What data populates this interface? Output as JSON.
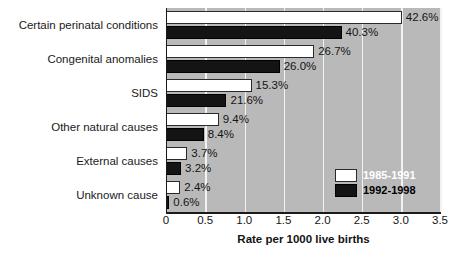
{
  "chart_data": {
    "type": "bar",
    "orientation": "horizontal",
    "title": "",
    "xlabel": "Rate per 1000 live births",
    "ylabel": "",
    "xlim": [
      0,
      3.5
    ],
    "xticks": [
      "0",
      "0.5",
      "1.0",
      "1.5",
      "2.0",
      "2.5",
      "3.0",
      "3.5"
    ],
    "xtick_values": [
      0,
      0.5,
      1.0,
      1.5,
      2.0,
      2.5,
      3.0,
      3.5
    ],
    "grid": true,
    "grid_axis": "x",
    "legend_position": "bottom-right",
    "categories": [
      "Certain perinatal conditions",
      "Congenital anomalies",
      "SIDS",
      "Other natural causes",
      "External causes",
      "Unknown cause"
    ],
    "series": [
      {
        "name": "1985-1991",
        "color": "#ffffff",
        "values": [
          3.0,
          1.88,
          1.08,
          0.66,
          0.26,
          0.17
        ],
        "labels": [
          "42.6%",
          "26.7%",
          "15.3%",
          "9.4%",
          "3.7%",
          "2.4%"
        ]
      },
      {
        "name": "1992-1998",
        "color": "#141414",
        "values": [
          2.23,
          1.44,
          0.76,
          0.47,
          0.18,
          0.03
        ],
        "labels": [
          "40.3%",
          "26.0%",
          "21.6%",
          "8.4%",
          "3.2%",
          "0.6%"
        ]
      }
    ],
    "plot_background": "#b9b9b9",
    "gridline_color": "#f2f2f2"
  },
  "legend": {
    "items": [
      {
        "label": "1985-1991",
        "swatch": "white"
      },
      {
        "label": "1992-1998",
        "swatch": "black"
      }
    ]
  }
}
